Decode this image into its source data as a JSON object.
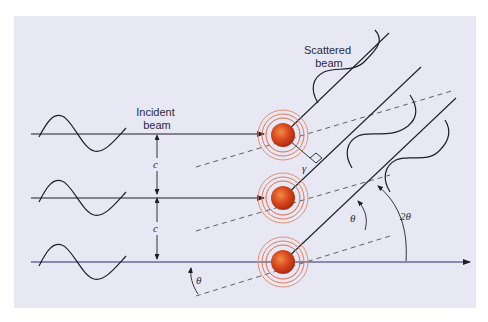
{
  "labels": {
    "incident": [
      "Incident",
      "beam"
    ],
    "scattered": [
      "Scattered",
      "beam"
    ],
    "spacing_top": "c",
    "spacing_bottom": "c",
    "theta_bottom": "θ",
    "theta_mid": "θ",
    "two_theta": "2θ",
    "gamma": "γ"
  },
  "colors": {
    "panel_bg": "#e8e8f4",
    "line": "#1e1e2a",
    "atom": "#d2401a",
    "atom_highlight": "#f07a3a",
    "ring": "#e0785a",
    "baseline": "#2a2a7a"
  },
  "atoms": [
    {
      "name": "atom-top",
      "cx": 283,
      "cy": 135
    },
    {
      "name": "atom-middle",
      "cx": 283,
      "cy": 198
    },
    {
      "name": "atom-bottom",
      "cx": 283,
      "cy": 262
    }
  ]
}
